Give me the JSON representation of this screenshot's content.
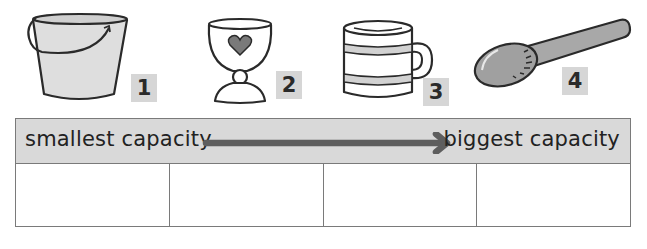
{
  "items": [
    {
      "id": 1,
      "name": "bucket",
      "label": "1"
    },
    {
      "id": 2,
      "name": "egg-cup",
      "label": "2"
    },
    {
      "id": 3,
      "name": "mug",
      "label": "3"
    },
    {
      "id": 4,
      "name": "spoon",
      "label": "4"
    }
  ],
  "ordering_table": {
    "left_label": "smallest capacity",
    "right_label": "biggest capacity",
    "arrow_direction": "right",
    "answer_cells": [
      "",
      "",
      "",
      ""
    ]
  },
  "colors": {
    "header_fill": "#d9d9d9",
    "badge_fill": "#d6d6d6",
    "arrow": "#5e5e5e",
    "outline": "#2a2a2a",
    "light_fill": "#dedede",
    "spoon_fill": "#a8a8a8",
    "heart_fill": "#7a7a7a"
  }
}
